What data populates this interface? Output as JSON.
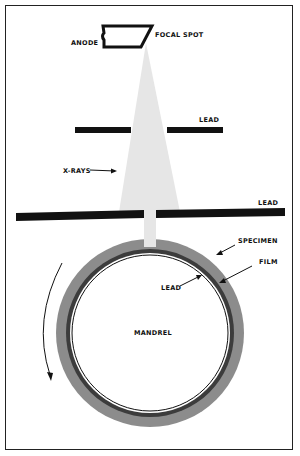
{
  "diagram": {
    "type": "radiography-setup",
    "labels": {
      "anode": "ANODE",
      "focal_spot": "FOCAL SPOT",
      "lead_upper": "LEAD",
      "xrays": "X-RAYS",
      "lead_lower": "LEAD",
      "specimen": "SPECIMEN",
      "film": "FILM",
      "lead_inner": "LEAD",
      "mandrel": "MANDREL"
    },
    "colors": {
      "beam": "#e4e4e4",
      "lead": "#111111",
      "specimen": "#8a8a8a",
      "film": "#3a3a3a",
      "mandrel": "#ffffff",
      "border": "#222222"
    }
  }
}
